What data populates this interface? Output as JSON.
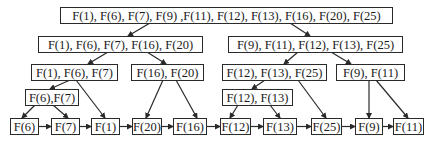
{
  "diagram": {
    "type": "tree",
    "nodes": {
      "root": "F(1), F(6), F(7), F(9) ,F(11), F(12), F(13), F(16), F(20), F(25)",
      "l1_left": "F(1), F(6), F(7), F(16), F(20)",
      "l1_right": "F(9), F(11), F(12), F(13), F(25)",
      "l2_a": "F(1), F(6), F(7)",
      "l2_b": "F(16), F(20)",
      "l2_c": "F(12), F(13), F(25)",
      "l2_d": "F(9), F(11)",
      "l3_a": "F(6),F(7)",
      "l3_c": "F(12), F(13)",
      "leaf_f6": "F(6)",
      "leaf_f7": "F(7)",
      "leaf_f1": "F(1)",
      "leaf_f20": "F(20)",
      "leaf_f16": "F(16)",
      "leaf_f12": "F(12)",
      "leaf_f13": "F(13)",
      "leaf_f25": "F(25)",
      "leaf_f9": "F(9)",
      "leaf_f11": "F(11)"
    },
    "edges": [
      [
        "root",
        "l1_left"
      ],
      [
        "root",
        "l1_right"
      ],
      [
        "l1_left",
        "l2_a"
      ],
      [
        "l1_left",
        "l2_b"
      ],
      [
        "l1_right",
        "l2_c"
      ],
      [
        "l1_right",
        "l2_d"
      ],
      [
        "l2_a",
        "l3_a"
      ],
      [
        "l2_a",
        "leaf_f1"
      ],
      [
        "l3_a",
        "leaf_f6"
      ],
      [
        "l3_a",
        "leaf_f7"
      ],
      [
        "l2_b",
        "leaf_f20"
      ],
      [
        "l2_b",
        "leaf_f16"
      ],
      [
        "l2_c",
        "l3_c"
      ],
      [
        "l2_c",
        "leaf_f25"
      ],
      [
        "l3_c",
        "leaf_f12"
      ],
      [
        "l3_c",
        "leaf_f13"
      ],
      [
        "l2_d",
        "leaf_f9"
      ],
      [
        "l2_d",
        "leaf_f11"
      ]
    ],
    "leaf_chain": [
      "F(6)",
      "F(7)",
      "F(1)",
      "F(20)",
      "F(16)",
      "F(12)",
      "F(13)",
      "F(25)",
      "F(9)",
      "F(11)"
    ],
    "colors": {
      "stroke": "#2a2a2a",
      "background": "#ffffff",
      "text": "#1a1a1a"
    }
  }
}
